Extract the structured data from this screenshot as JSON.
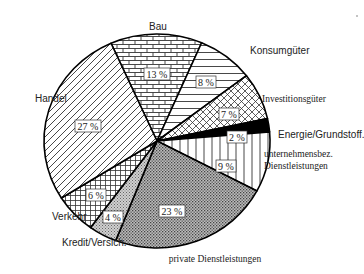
{
  "chart_data": {
    "type": "pie",
    "title": "",
    "start_angle_deg": 336,
    "direction": "clockwise",
    "slices": [
      {
        "label": "Bau",
        "value": 13,
        "pct_label": "13 %",
        "pattern": "brick",
        "label_font": "sans",
        "label_pos": [
          158,
          30
        ],
        "pct_pos": [
          157,
          74
        ]
      },
      {
        "label": "Konsumgüter",
        "value": 8,
        "pct_label": "8 %",
        "pattern": "hlines",
        "label_font": "sans",
        "label_pos": [
          250,
          54
        ],
        "pct_pos": [
          206,
          82
        ]
      },
      {
        "label": "Investitionsgüter",
        "value": 7,
        "pct_label": "7 %",
        "pattern": "crosshatch-diag",
        "label_font": "serif",
        "label_pos": [
          262,
          102
        ],
        "pct_pos": [
          229,
          114
        ]
      },
      {
        "label": "Energie/Grundstoff.",
        "value": 2,
        "pct_label": "2 %",
        "pattern": "solid-black",
        "label_font": "sans",
        "label_pos": [
          278,
          138
        ],
        "pct_pos": [
          237,
          137
        ]
      },
      {
        "label": [
          "unternehmensbez.",
          "Dienstleistungen"
        ],
        "value": 9,
        "pct_label": "9 %",
        "pattern": "vlines",
        "label_font": "serif",
        "label_pos": [
          264,
          157
        ],
        "pct_pos": [
          226,
          166
        ]
      },
      {
        "label": "private Dienstleistungen",
        "value": 23,
        "pct_label": "23 %",
        "pattern": "dense-dots",
        "label_font": "serif",
        "label_pos": [
          215,
          262
        ],
        "pct_pos": [
          172,
          211
        ]
      },
      {
        "label": "Kredit/Versich.",
        "value": 4,
        "pct_label": "4 %",
        "pattern": "light-dots",
        "label_font": "sans",
        "label_pos": [
          62,
          246
        ],
        "pct_pos": [
          113,
          217
        ]
      },
      {
        "label": "Verkehr",
        "value": 6,
        "pct_label": "6 %",
        "pattern": "grid",
        "label_font": "sans",
        "label_pos": [
          52,
          220
        ],
        "pct_pos": [
          96,
          195
        ]
      },
      {
        "label": "Handel",
        "value": 27,
        "pct_label": "27 %",
        "pattern": "diag",
        "label_font": "sans",
        "label_pos": [
          35,
          102
        ],
        "pct_pos": [
          88,
          126
        ]
      }
    ],
    "center": [
      157,
      141
    ],
    "radius": [
      113,
      107
    ]
  }
}
